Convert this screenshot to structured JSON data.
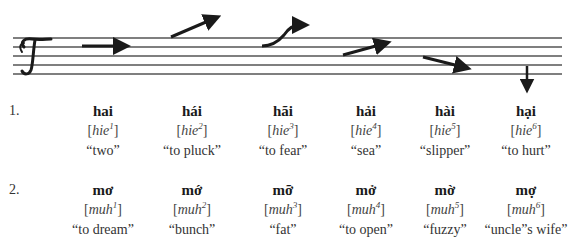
{
  "staff": {
    "clef_glyph": "𝒯",
    "line_color": "#555555",
    "arrow_color": "#1a1a1a",
    "tone_contours": [
      {
        "tone": 1,
        "direction": "level-right"
      },
      {
        "tone": 2,
        "direction": "rising"
      },
      {
        "tone": 3,
        "direction": "rising-broken"
      },
      {
        "tone": 4,
        "direction": "low-rising"
      },
      {
        "tone": 5,
        "direction": "falling"
      },
      {
        "tone": 6,
        "direction": "drop-down"
      }
    ]
  },
  "rows": [
    {
      "label": "1.",
      "items": [
        {
          "word": "hai",
          "ipa_base": "hie",
          "tone": "1",
          "gloss": "“two”"
        },
        {
          "word": "hái",
          "ipa_base": "hie",
          "tone": "2",
          "gloss": "“to pluck”"
        },
        {
          "word": "hãi",
          "ipa_base": "hie",
          "tone": "3",
          "gloss": "“to fear”"
        },
        {
          "word": "hải",
          "ipa_base": "hie",
          "tone": "4",
          "gloss": "“sea”"
        },
        {
          "word": "hài",
          "ipa_base": "hie",
          "tone": "5",
          "gloss": "“slipper”"
        },
        {
          "word": "hại",
          "ipa_base": "hie",
          "tone": "6",
          "gloss": "“to hurt”"
        }
      ]
    },
    {
      "label": "2.",
      "items": [
        {
          "word": "mơ",
          "ipa_base": "muh",
          "tone": "1",
          "gloss": "“to dream”"
        },
        {
          "word": "mớ",
          "ipa_base": "muh",
          "tone": "2",
          "gloss": "“bunch”"
        },
        {
          "word": "mỡ",
          "ipa_base": "muh",
          "tone": "3",
          "gloss": "“fat”"
        },
        {
          "word": "mở",
          "ipa_base": "muh",
          "tone": "4",
          "gloss": "“to open”"
        },
        {
          "word": "mờ",
          "ipa_base": "muh",
          "tone": "5",
          "gloss": "“fuzzy”"
        },
        {
          "word": "mợ",
          "ipa_base": "muh",
          "tone": "6",
          "gloss": "“uncle”s wife”"
        }
      ]
    }
  ],
  "brackets": {
    "open": "[",
    "close": "]"
  }
}
